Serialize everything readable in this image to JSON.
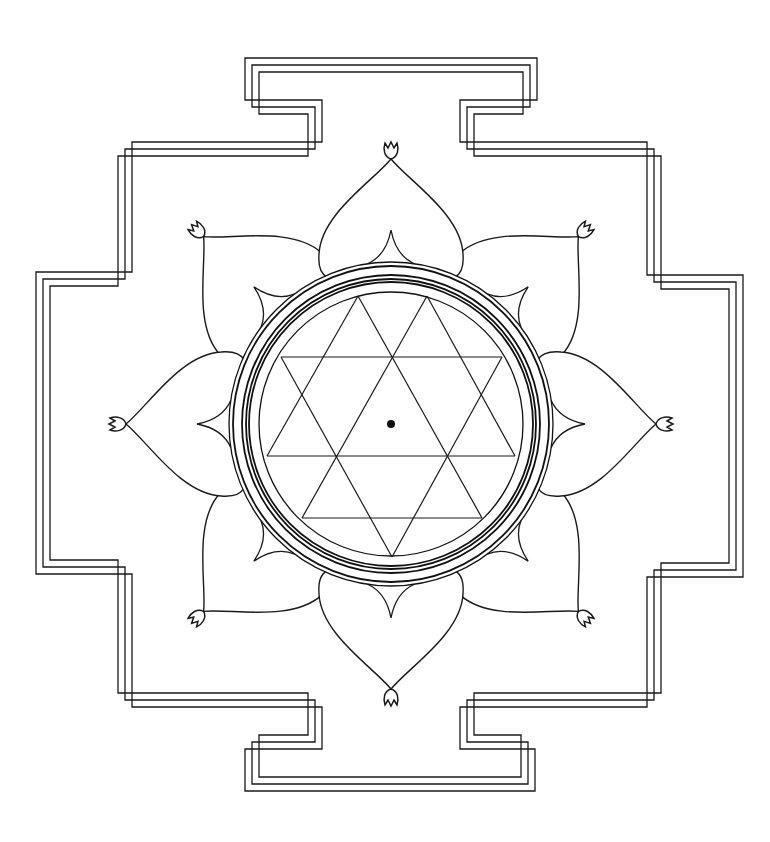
{
  "figure": {
    "title": "Yantra line drawing"
  },
  "colors": {
    "background": "#ffffff",
    "line": "#1a1a1a"
  },
  "geometry": {
    "center": [
      391,
      424
    ],
    "rings_radii": [
      162,
      158,
      149,
      145,
      142,
      132
    ],
    "petal_count": 8,
    "petal_tip_radius": 265,
    "gate_count": 4,
    "frame_line_count": 3,
    "triangle_segments": [
      [
        358,
        296,
        267,
        456
      ],
      [
        358,
        296,
        482,
        518
      ],
      [
        427,
        296,
        515,
        456
      ],
      [
        427,
        296,
        302,
        518
      ],
      [
        392,
        557,
        281,
        357
      ],
      [
        392,
        557,
        502,
        357
      ],
      [
        281,
        357,
        502,
        357
      ],
      [
        267,
        456,
        515,
        456
      ],
      [
        302,
        518,
        482,
        518
      ]
    ],
    "bindu": [
      391,
      424,
      4
    ]
  },
  "elements": {
    "frame_label": "square frame with four gates",
    "lotus_label": "eight lotus petals with buds",
    "rings_label": "concentric rings",
    "triangles_label": "interlaced triangles",
    "bindu_label": "central point"
  }
}
